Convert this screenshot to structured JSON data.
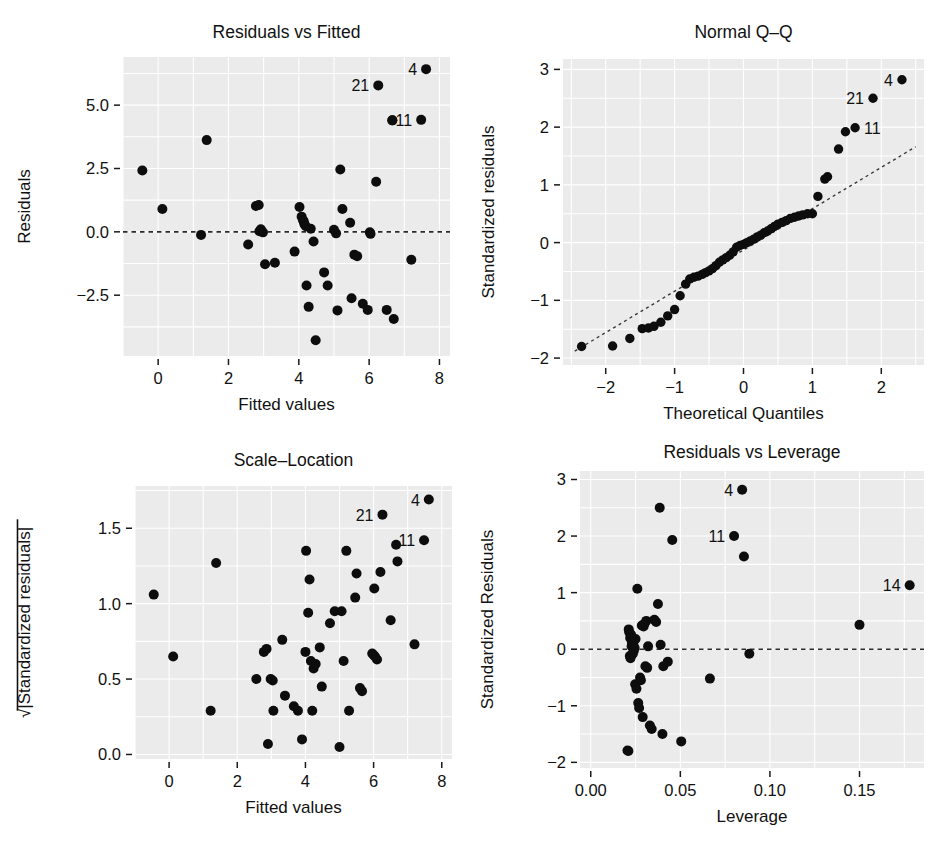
{
  "figure": {
    "name": "regression-diagnostic-plots",
    "layout": "2x2",
    "panel_background": "#ebebeb",
    "grid_color": "#ffffff",
    "point_color": "#0d0d0d"
  },
  "chart_data": [
    {
      "type": "scatter",
      "name": "residuals-vs-fitted",
      "title": "Residuals vs Fitted",
      "xlabel": "Fitted values",
      "ylabel": "Residuals",
      "xlim": [
        -1.0,
        8.3
      ],
      "ylim": [
        -4.9,
        6.9
      ],
      "xticks": [
        0,
        2,
        4,
        6,
        8
      ],
      "xticklabels": [
        "0",
        "2",
        "4",
        "6",
        "8"
      ],
      "yticks": [
        -2.5,
        0.0,
        2.5,
        5.0
      ],
      "yticklabels": [
        "−2.5",
        "0.0",
        "2.5",
        "5.0"
      ],
      "grid": true,
      "reference_line": {
        "type": "horizontal",
        "y": 0.0,
        "style": "dashed"
      },
      "x": [
        -0.45,
        0.12,
        1.22,
        1.38,
        2.56,
        2.78,
        2.86,
        2.88,
        2.92,
        2.98,
        3.04,
        3.32,
        3.88,
        4.02,
        4.08,
        4.12,
        4.14,
        4.16,
        4.2,
        4.22,
        4.28,
        4.34,
        4.42,
        4.48,
        4.72,
        4.82,
        5.0,
        5.06,
        5.1,
        5.18,
        5.24,
        5.46,
        5.5,
        5.58,
        5.66,
        5.82,
        5.96,
        6.02,
        6.04,
        6.2,
        6.26,
        6.5,
        6.66,
        6.7,
        7.2,
        7.48,
        7.62
      ],
      "y": [
        2.42,
        0.9,
        -0.12,
        3.62,
        -0.5,
        1.02,
        1.06,
        0.02,
        0.1,
        -0.02,
        -1.28,
        -1.22,
        -0.78,
        0.98,
        0.6,
        0.46,
        0.42,
        0.3,
        0.22,
        -2.12,
        -2.96,
        0.12,
        -0.38,
        -4.28,
        -1.6,
        -2.12,
        0.08,
        -0.06,
        -3.1,
        2.46,
        0.9,
        0.36,
        -2.62,
        -0.9,
        -0.96,
        -2.84,
        -3.08,
        -0.02,
        -0.08,
        1.98,
        5.78,
        -3.08,
        4.4,
        -3.44,
        -1.1,
        4.42,
        6.42
      ],
      "labeled_points": [
        {
          "label": "4",
          "x": 7.62,
          "y": 6.42,
          "side": "left"
        },
        {
          "label": "21",
          "x": 6.26,
          "y": 5.78,
          "side": "left"
        },
        {
          "label": "11",
          "x": 7.48,
          "y": 4.42,
          "side": "left"
        }
      ],
      "extra_labeled_marker": {
        "label": "",
        "x": 6.66,
        "y": 4.4
      }
    },
    {
      "type": "scatter",
      "name": "normal-qq",
      "title": "Normal Q–Q",
      "xlabel": "Theoretical Quantiles",
      "ylabel": "Standardized residuals",
      "xlim": [
        -2.62,
        2.62
      ],
      "ylim": [
        -2.12,
        3.18
      ],
      "xticks": [
        -2,
        -1,
        0,
        1,
        2
      ],
      "xticklabels": [
        "−2",
        "−1",
        "0",
        "1",
        "2"
      ],
      "yticks": [
        -2,
        -1,
        0,
        1,
        2,
        3
      ],
      "yticklabels": [
        "−2",
        "−1",
        "0",
        "1",
        "2",
        "3"
      ],
      "grid": true,
      "reference_line": {
        "type": "qq-diagonal",
        "x0": -2.45,
        "y0": -1.88,
        "x1": 2.5,
        "y1": 1.66,
        "style": "dashed"
      },
      "x": [
        -2.35,
        -1.9,
        -1.65,
        -1.47,
        -1.38,
        -1.3,
        -1.2,
        -1.1,
        -1.0,
        -0.92,
        -0.84,
        -0.78,
        -0.72,
        -0.66,
        -0.6,
        -0.55,
        -0.5,
        -0.45,
        -0.4,
        -0.35,
        -0.3,
        -0.25,
        -0.2,
        -0.15,
        -0.1,
        -0.05,
        0.0,
        0.05,
        0.1,
        0.15,
        0.2,
        0.25,
        0.3,
        0.35,
        0.4,
        0.45,
        0.5,
        0.56,
        0.62,
        0.68,
        0.74,
        0.8,
        0.86,
        0.93,
        1.0,
        1.08,
        1.18,
        1.22,
        1.38,
        1.48,
        1.62,
        1.88,
        2.3
      ],
      "y": [
        -1.8,
        -1.79,
        -1.66,
        -1.49,
        -1.48,
        -1.45,
        -1.38,
        -1.27,
        -1.16,
        -0.92,
        -0.72,
        -0.63,
        -0.6,
        -0.58,
        -0.55,
        -0.52,
        -0.49,
        -0.45,
        -0.4,
        -0.34,
        -0.3,
        -0.26,
        -0.22,
        -0.16,
        -0.08,
        -0.05,
        -0.03,
        0.0,
        0.03,
        0.06,
        0.1,
        0.13,
        0.17,
        0.2,
        0.24,
        0.28,
        0.32,
        0.35,
        0.38,
        0.42,
        0.44,
        0.46,
        0.48,
        0.5,
        0.5,
        0.8,
        1.1,
        1.14,
        1.62,
        1.92,
        1.99,
        2.5,
        2.82
      ],
      "labeled_points": [
        {
          "label": "4",
          "x": 2.3,
          "y": 2.82,
          "side": "left"
        },
        {
          "label": "21",
          "x": 1.88,
          "y": 2.5,
          "side": "left"
        },
        {
          "label": "11",
          "x": 1.62,
          "y": 1.99,
          "side": "right"
        }
      ]
    },
    {
      "type": "scatter",
      "name": "scale-location",
      "title": "Scale–Location",
      "xlabel": "Fitted values",
      "ylabel": "√|Standardized residuals|",
      "xlim": [
        -1.0,
        8.3
      ],
      "ylim": [
        -0.03,
        1.78
      ],
      "xticks": [
        0,
        2,
        4,
        6,
        8
      ],
      "xticklabels": [
        "0",
        "2",
        "4",
        "6",
        "8"
      ],
      "yticks": [
        0.0,
        0.5,
        1.0,
        1.5
      ],
      "yticklabels": [
        "0.0",
        "0.5",
        "1.0",
        "1.5"
      ],
      "grid": true,
      "x": [
        -0.45,
        0.12,
        1.22,
        1.38,
        2.56,
        2.78,
        2.86,
        2.9,
        2.98,
        3.04,
        3.06,
        3.32,
        3.4,
        3.66,
        3.78,
        3.9,
        4.0,
        4.02,
        4.08,
        4.12,
        4.16,
        4.2,
        4.24,
        4.3,
        4.42,
        4.48,
        4.72,
        4.86,
        5.0,
        5.06,
        5.12,
        5.2,
        5.28,
        5.46,
        5.5,
        5.6,
        5.66,
        5.96,
        6.0,
        6.02,
        6.04,
        6.1,
        6.2,
        6.26,
        6.5,
        6.66,
        6.7,
        7.2,
        7.48,
        7.62
      ],
      "y": [
        1.06,
        0.65,
        0.29,
        1.27,
        0.5,
        0.68,
        0.7,
        0.07,
        0.5,
        0.49,
        0.29,
        0.76,
        0.39,
        0.32,
        0.29,
        0.1,
        0.68,
        1.35,
        0.94,
        1.16,
        0.62,
        0.29,
        0.57,
        0.6,
        0.71,
        0.45,
        0.87,
        0.95,
        0.05,
        0.95,
        0.62,
        1.35,
        0.29,
        1.04,
        1.2,
        0.44,
        0.42,
        0.67,
        0.66,
        1.1,
        0.65,
        0.63,
        1.21,
        1.59,
        0.89,
        1.39,
        1.28,
        0.73,
        1.42,
        1.69
      ],
      "labeled_points": [
        {
          "label": "4",
          "x": 7.62,
          "y": 1.69,
          "side": "left"
        },
        {
          "label": "21",
          "x": 6.26,
          "y": 1.59,
          "side": "left"
        },
        {
          "label": "11",
          "x": 7.48,
          "y": 1.42,
          "side": "left"
        }
      ]
    },
    {
      "type": "scatter",
      "name": "residuals-vs-leverage",
      "title": "Residuals vs Leverage",
      "xlabel": "Leverage",
      "ylabel": "Standardized Residuals",
      "xlim": [
        -0.006,
        0.186
      ],
      "ylim": [
        -2.1,
        3.15
      ],
      "xticks": [
        0.0,
        0.05,
        0.1,
        0.15
      ],
      "xticklabels": [
        "0.00",
        "0.05",
        "0.10",
        "0.15"
      ],
      "yticks": [
        -2,
        -1,
        0,
        1,
        2,
        3
      ],
      "yticklabels": [
        "−2",
        "−1",
        "0",
        "1",
        "2",
        "3"
      ],
      "grid": true,
      "reference_line": {
        "type": "horizontal",
        "y": 0.0,
        "style": "dashed"
      },
      "x": [
        0.0205,
        0.021,
        0.0212,
        0.0215,
        0.0218,
        0.022,
        0.0222,
        0.0225,
        0.0228,
        0.023,
        0.0232,
        0.0235,
        0.0238,
        0.024,
        0.0242,
        0.0245,
        0.0248,
        0.025,
        0.0255,
        0.026,
        0.0265,
        0.027,
        0.0275,
        0.028,
        0.0285,
        0.029,
        0.0295,
        0.03,
        0.0305,
        0.031,
        0.0315,
        0.032,
        0.033,
        0.034,
        0.0355,
        0.0365,
        0.0375,
        0.0385,
        0.039,
        0.04,
        0.0405,
        0.043,
        0.0455,
        0.0505,
        0.0665,
        0.08,
        0.0845,
        0.0855,
        0.0885,
        0.15,
        0.178
      ],
      "y": [
        -1.79,
        -1.8,
        0.35,
        0.3,
        -0.12,
        0.2,
        -0.16,
        0.26,
        0.05,
        0.12,
        0.1,
        -0.08,
        0.08,
        -0.03,
        0.16,
        0.02,
        -0.62,
        0.18,
        -0.7,
        1.07,
        -0.95,
        -1.04,
        -0.5,
        -0.55,
        0.42,
        -1.2,
        0.4,
        0.45,
        -0.3,
        0.5,
        -0.33,
        0.05,
        -1.35,
        -1.41,
        0.52,
        0.48,
        0.8,
        2.5,
        0.08,
        -1.5,
        -0.3,
        -0.22,
        1.93,
        -1.63,
        -0.52,
        2.0,
        2.82,
        1.64,
        -0.08,
        0.43,
        1.13
      ],
      "labeled_points": [
        {
          "label": "4",
          "x": 0.0845,
          "y": 2.82,
          "side": "left"
        },
        {
          "label": "11",
          "x": 0.08,
          "y": 2.0,
          "side": "left"
        },
        {
          "label": "14",
          "x": 0.178,
          "y": 1.13,
          "side": "left"
        }
      ]
    }
  ]
}
